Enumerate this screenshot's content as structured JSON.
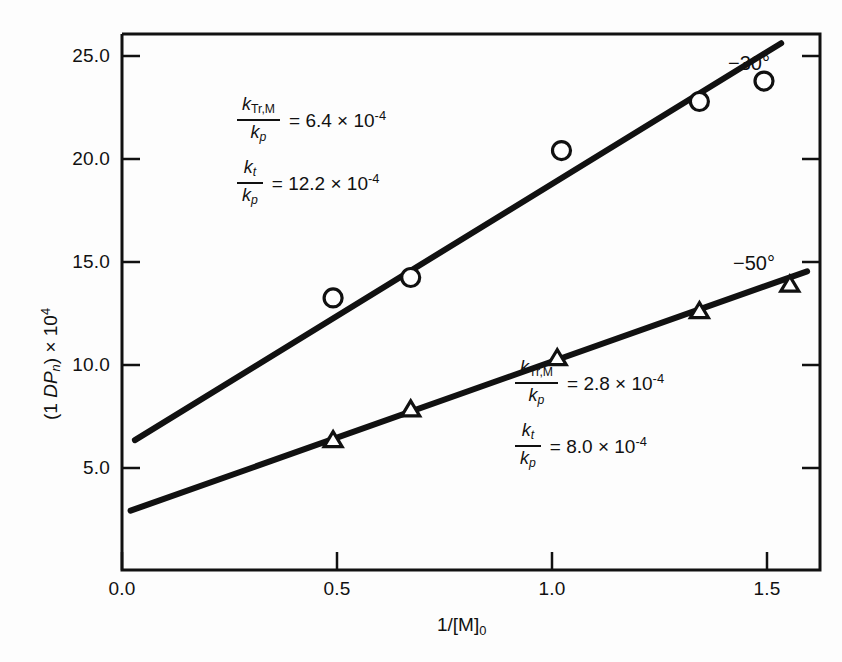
{
  "chart_data": {
    "type": "scatter",
    "title": "",
    "xlabel": "1/[M]₀",
    "ylabel": "(1 DPₙ) × 10⁴",
    "xlim": [
      0.0,
      1.62
    ],
    "ylim": [
      0.0,
      26.2
    ],
    "xticks": [
      "0.0",
      "0.5",
      "1.0",
      "1.5"
    ],
    "xtick_values": [
      0.0,
      0.5,
      1.0,
      1.5
    ],
    "yticks": [
      "5.0",
      "10.0",
      "15.0",
      "20.0",
      "25.0"
    ],
    "ytick_values": [
      5.0,
      10.0,
      15.0,
      20.0,
      25.0
    ],
    "grid": false,
    "legend_position": "inline-right-of-line-ends",
    "series": [
      {
        "name": "-30°",
        "marker": "circle",
        "x": [
          0.49,
          0.67,
          1.02,
          1.34,
          1.49
        ],
        "y": [
          13.3,
          14.3,
          20.5,
          22.9,
          23.9
        ],
        "fit_line": {
          "x_start": 0.03,
          "y_start": 6.35,
          "x_end": 1.53,
          "y_end": 25.75,
          "intercept": 6.3,
          "slope": 12.9
        }
      },
      {
        "name": "-50°",
        "marker": "triangle",
        "x": [
          0.49,
          0.67,
          1.01,
          1.34,
          1.55
        ],
        "y": [
          6.4,
          7.9,
          10.4,
          12.7,
          14.0
        ],
        "fit_line": {
          "x_start": 0.02,
          "y_start": 2.9,
          "x_end": 1.59,
          "y_end": 14.6,
          "intercept": 2.85,
          "slope": 7.45
        }
      }
    ],
    "annotations": [
      {
        "id": "upper",
        "series": "-30°",
        "equations": [
          {
            "numerator": "k",
            "numerator_sub": "Tr,M",
            "denominator": "k",
            "denominator_sub": "p",
            "rhs": "= 6.4 × 10",
            "rhs_exp": "-4"
          },
          {
            "numerator": "k",
            "numerator_sub": "t",
            "denominator": "k",
            "denominator_sub": "p",
            "rhs": "= 12.2 × 10",
            "rhs_exp": "-4"
          }
        ]
      },
      {
        "id": "lower",
        "series": "-50°",
        "equations": [
          {
            "numerator": "k",
            "numerator_sub": "Tr,M",
            "denominator": "k",
            "denominator_sub": "p",
            "rhs": "= 2.8 × 10",
            "rhs_exp": "-4"
          },
          {
            "numerator": "k",
            "numerator_sub": "t",
            "denominator": "k",
            "denominator_sub": "p",
            "rhs": "= 8.0 × 10",
            "rhs_exp": "-4"
          }
        ]
      }
    ]
  },
  "axes": {
    "ylabel_main": "(1 ",
    "ylabel_italic": "DP",
    "ylabel_sub": "n",
    "ylabel_tail": ") × 10",
    "ylabel_exp": "4",
    "xlabel_main": "1/[M]",
    "xlabel_sub": "0"
  },
  "ticks": {
    "y": [
      {
        "label": "25.0"
      },
      {
        "label": "20.0"
      },
      {
        "label": "15.0"
      },
      {
        "label": "10.0"
      },
      {
        "label": "5.0"
      }
    ],
    "x": [
      {
        "label": "0.0"
      },
      {
        "label": "0.5"
      },
      {
        "label": "1.0"
      },
      {
        "label": "1.5"
      }
    ]
  },
  "series_labels": {
    "upper": "−30°",
    "lower": "−50°"
  },
  "colors": {
    "axis": "#111111",
    "line": "#111111",
    "marker_stroke": "#111111",
    "marker_fill": "#ffffff",
    "background": "#fdfdfd"
  }
}
